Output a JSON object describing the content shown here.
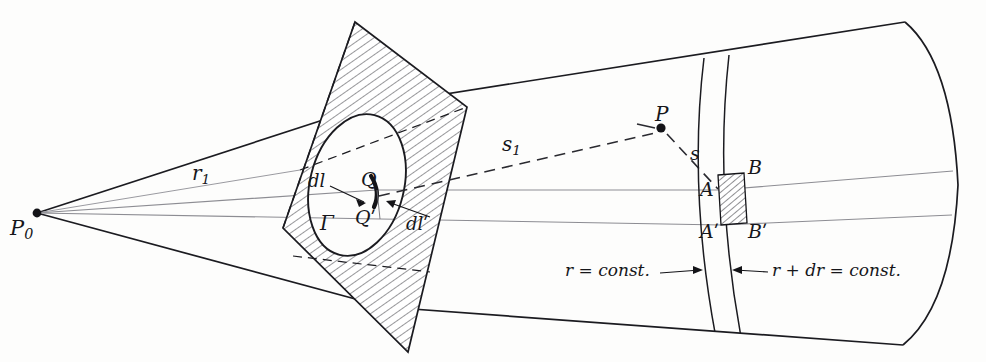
{
  "figure": {
    "kind": "optical-diffraction-geometry",
    "background_color": "#fdfdfc",
    "ink_color": "#16161a",
    "ray_color": "#8d8d93",
    "width": 986,
    "height": 362
  },
  "labels": {
    "source_point": "P",
    "source_point_sub": "0",
    "aperture_contour": "Γ",
    "point_Q": "Q",
    "point_Q_prime": "Qʹ",
    "element_dl": "dl",
    "element_dl_prime": "dlʹ",
    "radius_r1": "r",
    "radius_r1_sub": "1",
    "distance_s1": "s",
    "distance_s1_sub": "1",
    "distance_s": "s",
    "observation_point": "P",
    "point_A": "A",
    "point_B": "B",
    "point_A_prime": "Aʹ",
    "point_B_prime": "Bʹ",
    "arc_inner": "r = const.",
    "arc_outer": "r + dr = const."
  },
  "geometry": {
    "source": {
      "x": 36,
      "y": 213
    },
    "observation": {
      "x": 661,
      "y": 128
    },
    "point_Q": {
      "x": 377,
      "y": 190
    },
    "point_A": {
      "x": 719,
      "y": 190
    },
    "point_B": {
      "x": 744,
      "y": 175
    },
    "point_A_prime": {
      "x": 722,
      "y": 225
    },
    "point_B_prime": {
      "x": 747,
      "y": 222
    }
  }
}
